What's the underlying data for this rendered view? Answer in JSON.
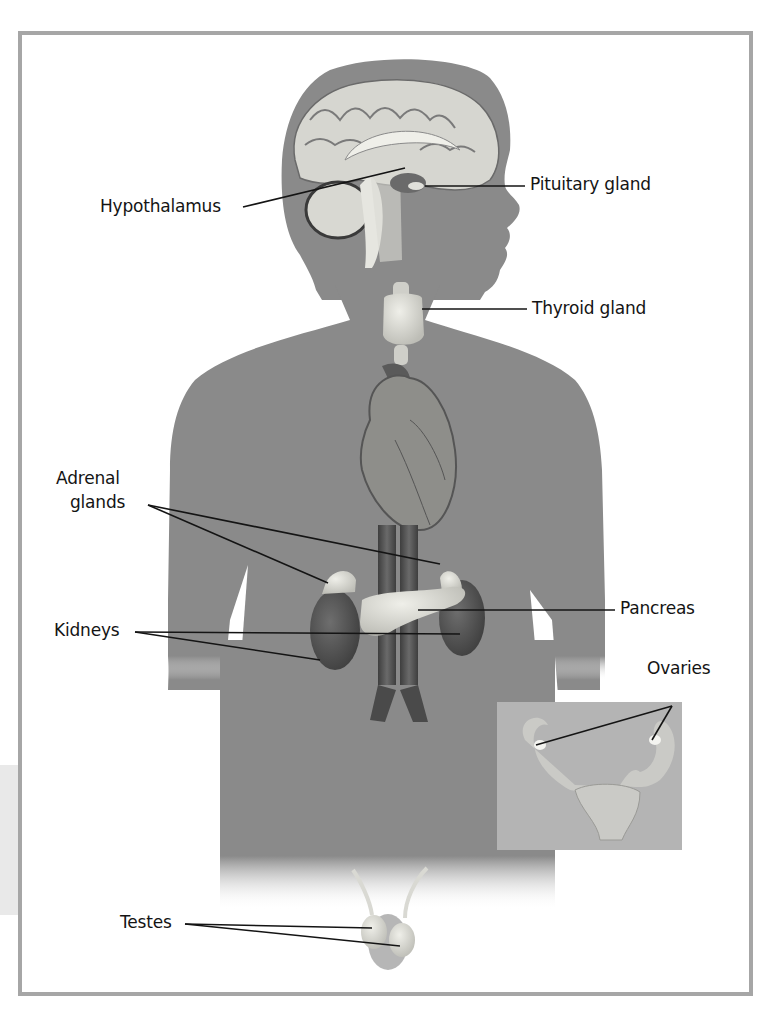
{
  "figure": {
    "colors": {
      "frame": "#a6a6a6",
      "silhouette": "#8a8a8a",
      "organ_light": "#dcdcd6",
      "organ_dark": "#4a4a4a",
      "inset_bg": "#b4b4b4",
      "label_text": "#141414"
    },
    "labels": {
      "hypothalamus": "Hypothalamus",
      "pituitary": "Pituitary gland",
      "thyroid": "Thyroid gland",
      "adrenal_line1": "Adrenal",
      "adrenal_line2": "glands",
      "kidneys": "Kidneys",
      "pancreas": "Pancreas",
      "ovaries": "Ovaries",
      "testes": "Testes"
    }
  }
}
